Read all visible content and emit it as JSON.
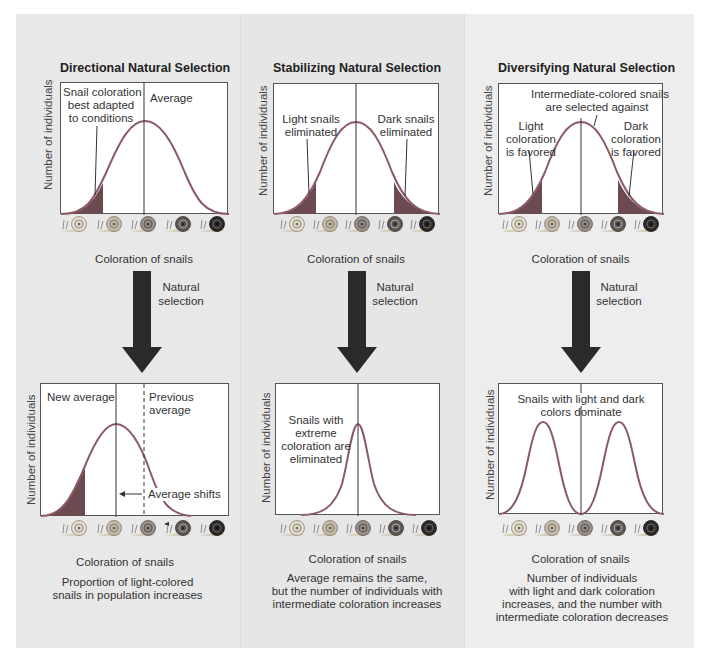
{
  "colors": {
    "panel_bg": "#e8e8e8",
    "chart_bg": "#ffffff",
    "curve": "#8c5a62",
    "shaded": "#6b4a50",
    "arrow": "#2a2a2a"
  },
  "common": {
    "y_axis_label": "Number of individuals",
    "x_axis_label": "Coloration of snails",
    "arrow_label": "Natural selection",
    "snail_icons": [
      "snail-lightest-icon",
      "snail-light-icon",
      "snail-medium-icon",
      "snail-dark-icon",
      "snail-darkest-icon"
    ]
  },
  "panels": [
    {
      "title": "Directional Natural Selection",
      "before": {
        "note_left": "Snail coloration best adapted to conditions",
        "note_left_lines": [
          "Snail coloration",
          "best adapted",
          "to conditions"
        ],
        "note_right": "Average"
      },
      "after": {
        "note_left": "New average",
        "note_right_lines": [
          "Previous",
          "average"
        ],
        "note_shift": "Average shifts"
      },
      "description_lines": [
        "Proportion of light-colored",
        "snails in population increases"
      ]
    },
    {
      "title": "Stabilizing Natural Selection",
      "before": {
        "note_left_lines": [
          "Light snails",
          "eliminated"
        ],
        "note_right_lines": [
          "Dark snails",
          "eliminated"
        ]
      },
      "after": {
        "note_lines": [
          "Snails with",
          "extreme",
          "coloration are",
          "eliminated"
        ]
      },
      "description_lines": [
        "Average remains the same,",
        "but the number of individuals with",
        "intermediate coloration increases"
      ]
    },
    {
      "title": "Diversifying Natural Selection",
      "before": {
        "note_top_lines": [
          "Intermediate-colored snails",
          "are selected against"
        ],
        "note_left_lines": [
          "Light",
          "coloration",
          "is favored"
        ],
        "note_right_lines": [
          "Dark",
          "coloration",
          "is favored"
        ]
      },
      "after": {
        "note_lines": [
          "Snails with light and dark",
          "colors dominate"
        ]
      },
      "description_lines": [
        "Number of individuals",
        "with light and dark coloration",
        "increases, and the number with",
        "intermediate coloration decreases"
      ]
    }
  ]
}
